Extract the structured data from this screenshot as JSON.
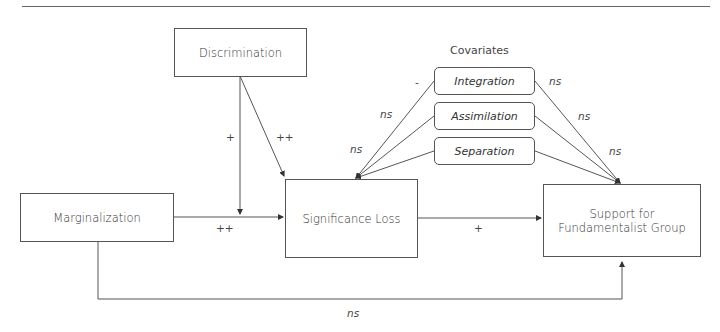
{
  "nodes": {
    "discrimination": "Discrimination",
    "marginalization": "Marginalization",
    "significance_loss": "Significance Loss",
    "support_line1": "Support for",
    "support_line2": "Fundamentalist Group"
  },
  "covariates": {
    "title": "Covariates",
    "items": [
      "Integration",
      "Assimilation",
      "Separation"
    ]
  },
  "paths": {
    "discrimination_moderation": "+",
    "discrimination_to_significance": "++",
    "marginalization_to_significance": "++",
    "significance_to_support": "+",
    "marginalization_to_support": "ns",
    "integration_to_significance": "-",
    "assimilation_to_significance": "ns",
    "separation_to_significance": "ns",
    "integration_to_support": "ns",
    "assimilation_to_support": "ns",
    "separation_to_support": "ns"
  }
}
